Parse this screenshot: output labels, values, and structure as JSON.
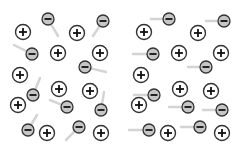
{
  "diagram": {
    "colors": {
      "ion_fill": "#ffffff",
      "ion_stroke": "#333333",
      "electron_fill": "#c6c6c6",
      "electron_stroke": "#333333",
      "arrow": "#d4d4d4"
    },
    "panels": [
      {
        "name": "random-motion",
        "ions": [
          [
            23,
            32
          ],
          [
            77,
            33
          ],
          [
            58,
            53
          ],
          [
            100,
            53
          ],
          [
            20,
            75
          ],
          [
            59,
            89
          ],
          [
            90,
            91
          ],
          [
            18,
            105
          ],
          [
            47,
            133
          ],
          [
            101,
            133
          ]
        ],
        "electrons": [
          {
            "pos": [
              48,
              19
            ],
            "arrow_from": [
              58,
              36
            ]
          },
          {
            "pos": [
              103,
              21
            ],
            "arrow_from": [
              93,
              36
            ]
          },
          {
            "pos": [
              32,
              54
            ],
            "arrow_from": [
              14,
              45
            ]
          },
          {
            "pos": [
              85,
              67
            ],
            "arrow_from": [
              106,
              72
            ]
          },
          {
            "pos": [
              33,
              95
            ],
            "arrow_from": [
              40,
              78
            ]
          },
          {
            "pos": [
              67,
              107
            ],
            "arrow_from": [
              50,
              100
            ]
          },
          {
            "pos": [
              101,
              110
            ],
            "arrow_from": [
              104,
              92
            ]
          },
          {
            "pos": [
              28,
              130
            ],
            "arrow_from": [
              37,
              115
            ]
          },
          {
            "pos": [
              79,
              127
            ],
            "arrow_from": [
              66,
              140
            ]
          }
        ]
      },
      {
        "name": "drift-motion",
        "ions": [
          [
            23,
            32
          ],
          [
            77,
            33
          ],
          [
            58,
            53
          ],
          [
            100,
            53
          ],
          [
            20,
            75
          ],
          [
            59,
            89
          ],
          [
            90,
            91
          ],
          [
            18,
            105
          ],
          [
            47,
            133
          ],
          [
            101,
            133
          ]
        ],
        "electrons": [
          {
            "pos": [
              48,
              19
            ],
            "arrow_from": [
              30,
              19
            ]
          },
          {
            "pos": [
              103,
              21
            ],
            "arrow_from": [
              85,
              21
            ]
          },
          {
            "pos": [
              32,
              54
            ],
            "arrow_from": [
              12,
              54
            ]
          },
          {
            "pos": [
              85,
              67
            ],
            "arrow_from": [
              67,
              67
            ]
          },
          {
            "pos": [
              33,
              95
            ],
            "arrow_from": [
              13,
              95
            ]
          },
          {
            "pos": [
              67,
              107
            ],
            "arrow_from": [
              48,
              107
            ]
          },
          {
            "pos": [
              101,
              110
            ],
            "arrow_from": [
              82,
              110
            ]
          },
          {
            "pos": [
              28,
              130
            ],
            "arrow_from": [
              8,
              130
            ]
          },
          {
            "pos": [
              79,
              127
            ],
            "arrow_from": [
              60,
              127
            ]
          }
        ]
      }
    ],
    "labels": {
      "ion_symbol": "+",
      "electron_symbol": "−"
    }
  }
}
